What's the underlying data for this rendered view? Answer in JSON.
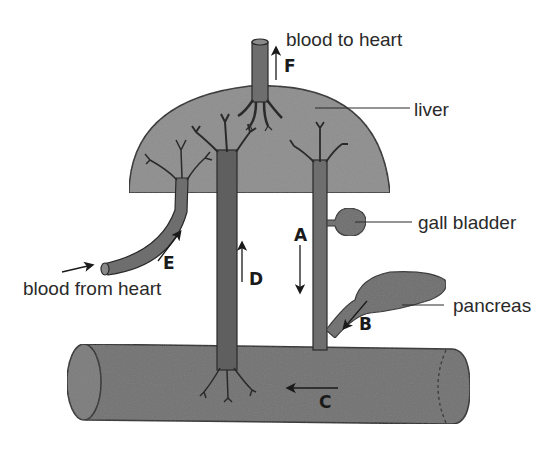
{
  "diagram": {
    "colors": {
      "organ_fill": "#8e8e8e",
      "vessel_fill": "#6e6e6e",
      "intestine_fill": "#727272",
      "outline": "#2a2a2a",
      "text": "#2a2a2a"
    },
    "labels": {
      "blood_to_heart": "blood to heart",
      "liver": "liver",
      "gall_bladder": "gall bladder",
      "pancreas": "pancreas",
      "blood_from_heart": "blood from heart"
    },
    "arrows": [
      {
        "letter": "A",
        "direction": "down",
        "meaning": "bile duct from gall bladder to intestine"
      },
      {
        "letter": "B",
        "direction": "down-left",
        "meaning": "pancreatic duct to intestine"
      },
      {
        "letter": "C",
        "direction": "left",
        "meaning": "flow along intestine"
      },
      {
        "letter": "D",
        "direction": "up",
        "meaning": "hepatic portal vein from intestine to liver"
      },
      {
        "letter": "E",
        "direction": "up-right",
        "meaning": "hepatic artery into liver"
      },
      {
        "letter": "F",
        "direction": "up",
        "meaning": "hepatic vein to heart"
      }
    ],
    "structures": [
      "liver",
      "gall bladder",
      "pancreas",
      "intestine",
      "hepatic vein",
      "hepatic artery",
      "hepatic portal vein",
      "bile duct"
    ]
  }
}
